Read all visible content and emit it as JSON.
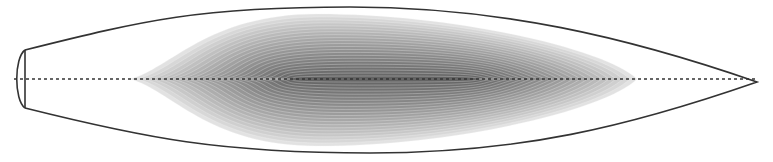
{
  "diagram": {
    "type": "streamlined-body-cross-section",
    "canvas": {
      "width": 773,
      "height": 162,
      "background": "#ffffff"
    },
    "outline": {
      "stroke": "#333333",
      "stroke_width": 1.6,
      "nose_cap": {
        "flat_x": 25,
        "top_y": 50,
        "bottom_y": 108,
        "bulge_x": 14
      },
      "top_peak": {
        "x": 350,
        "y": 7
      },
      "bottom_peak": {
        "x": 370,
        "y": 153
      },
      "tail_tip": {
        "x": 757,
        "y": 82
      }
    },
    "centerline": {
      "y": 79,
      "x_start": 14,
      "x_end": 757,
      "stroke": "#333333",
      "dash": "3 3"
    },
    "shaded_region": {
      "x_start": 130,
      "x_end": 637,
      "top_y": 14,
      "bottom_y": 146,
      "layers": 22,
      "outer_color": "#e2e2e2",
      "inner_color": "#5e5e5e",
      "contour_color": "#f4f4f4"
    }
  }
}
